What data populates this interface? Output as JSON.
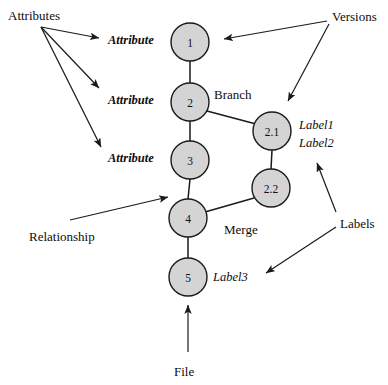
{
  "diagram": {
    "type": "node-link-diagram",
    "canvas": {
      "width": 388,
      "height": 385,
      "background": "#ffffff"
    },
    "style": {
      "node_fill": "#d4d4d4",
      "node_stroke": "#1a1a1a",
      "edge_color": "#1a1a1a",
      "text_color": "#0d0d0d"
    },
    "nodes": [
      {
        "id": "v1",
        "label": "1",
        "cx": 190,
        "cy": 42,
        "r": 19
      },
      {
        "id": "v2",
        "label": "2",
        "cx": 190,
        "cy": 102,
        "r": 19
      },
      {
        "id": "v3",
        "label": "3",
        "cx": 190,
        "cy": 160,
        "r": 19
      },
      {
        "id": "v4",
        "label": "4",
        "cx": 188,
        "cy": 218,
        "r": 19
      },
      {
        "id": "v5",
        "label": "5",
        "cx": 188,
        "cy": 277,
        "r": 19
      },
      {
        "id": "v2_1",
        "label": "2.1",
        "cx": 272,
        "cy": 131,
        "r": 19
      },
      {
        "id": "v2_2",
        "label": "2.2",
        "cx": 271,
        "cy": 188,
        "r": 19
      }
    ],
    "edges": [
      {
        "from": "v1",
        "to": "v2"
      },
      {
        "from": "v2",
        "to": "v3"
      },
      {
        "from": "v3",
        "to": "v4"
      },
      {
        "from": "v4",
        "to": "v5"
      },
      {
        "from": "v2",
        "to": "v2_1"
      },
      {
        "from": "v2_1",
        "to": "v2_2"
      },
      {
        "from": "v2_2",
        "to": "v4"
      }
    ],
    "attribute_labels": [
      {
        "text": "Attribute",
        "x": 108,
        "y": 34
      },
      {
        "text": "Attribute",
        "x": 108,
        "y": 94
      },
      {
        "text": "Attribute",
        "x": 108,
        "y": 152
      }
    ],
    "version_labels": [
      {
        "text": "Label1",
        "x": 299,
        "y": 119
      },
      {
        "text": "Label2",
        "x": 299,
        "y": 137
      },
      {
        "text": "Label3",
        "x": 213,
        "y": 271
      }
    ],
    "annotations": [
      {
        "name": "attributes",
        "text": "Attributes",
        "x": 8,
        "y": 9
      },
      {
        "name": "versions",
        "text": "Versions",
        "x": 332,
        "y": 10
      },
      {
        "name": "branch",
        "text": "Branch",
        "x": 214,
        "y": 88
      },
      {
        "name": "merge",
        "text": "Merge",
        "x": 224,
        "y": 223
      },
      {
        "name": "relationship",
        "text": "Relationship",
        "x": 29,
        "y": 230
      },
      {
        "name": "labels",
        "text": "Labels",
        "x": 340,
        "y": 217
      },
      {
        "name": "file",
        "text": "File",
        "x": 174,
        "y": 365
      }
    ]
  }
}
